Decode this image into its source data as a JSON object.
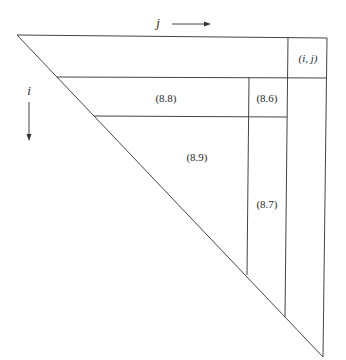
{
  "diagram": {
    "colors": {
      "line": "#444444",
      "background": "#ffffff",
      "text": "#2a2a2a"
    },
    "axes": {
      "column_index": {
        "label": "j",
        "direction": "right"
      },
      "row_index": {
        "label": "i",
        "direction": "down"
      }
    },
    "regions": [
      {
        "id": "entry",
        "label": "(i, j)"
      },
      {
        "id": "row-block",
        "label": "(8.8)"
      },
      {
        "id": "small-block",
        "label": "(8.6)"
      },
      {
        "id": "triangle-block",
        "label": "(8.9)"
      },
      {
        "id": "column-block",
        "label": "(8.7)"
      }
    ]
  }
}
